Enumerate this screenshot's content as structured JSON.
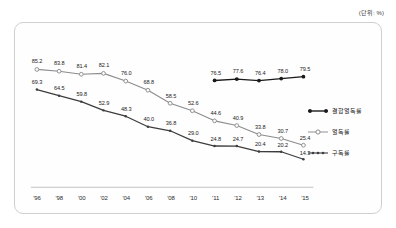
{
  "unit_note": "(단위: %)",
  "legend": {
    "position": "right",
    "items": [
      {
        "name": "combined-readership",
        "label": "결합열독률",
        "marker": "filled-circle",
        "color": "#1a1a1a"
      },
      {
        "name": "readership",
        "label": "열독률",
        "marker": "open-circle",
        "color": "#8c8c8c"
      },
      {
        "name": "subscription",
        "label": "구독률",
        "marker": "small-filled-circle",
        "color": "#3d3d3d"
      }
    ]
  },
  "chart_data": {
    "type": "line",
    "title": "",
    "subtitle": "",
    "xlabel": "",
    "ylabel": "",
    "unit": "%",
    "grid": false,
    "legend_position": "right",
    "ylim": [
      0,
      100
    ],
    "categories": [
      "'96",
      "'98",
      "'00",
      "'02",
      "'04",
      "'06",
      "'08",
      "'10",
      "'11",
      "'12",
      "'13",
      "'14",
      "'15"
    ],
    "series": [
      {
        "name": "결합열독률",
        "color": "#1a1a1a",
        "marker": "filled-circle",
        "values": [
          null,
          null,
          null,
          null,
          null,
          null,
          null,
          null,
          76.5,
          77.6,
          76.4,
          78.0,
          79.5
        ]
      },
      {
        "name": "열독률",
        "color": "#8c8c8c",
        "marker": "open-circle",
        "values": [
          85.2,
          83.8,
          81.4,
          82.1,
          76.0,
          68.8,
          58.5,
          52.6,
          44.6,
          40.9,
          33.8,
          30.7,
          25.4
        ]
      },
      {
        "name": "구독률",
        "color": "#3d3d3d",
        "marker": "small-filled-circle",
        "values": [
          69.3,
          64.5,
          59.8,
          52.9,
          48.3,
          40.0,
          36.8,
          29.0,
          24.8,
          24.7,
          20.4,
          20.2,
          14.3
        ]
      }
    ]
  }
}
